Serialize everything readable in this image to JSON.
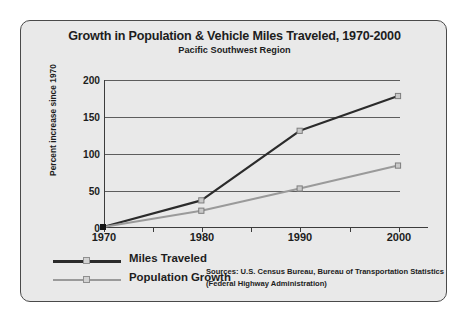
{
  "chart_data": {
    "type": "line",
    "title": "Growth in Population & Vehicle Miles Traveled, 1970-2000",
    "subtitle": "Pacific Southwest Region",
    "xlabel": "",
    "ylabel": "Percent increase since 1970",
    "x": [
      1970,
      1980,
      1990,
      2000
    ],
    "xtick_labels": [
      "1970",
      "1980",
      "1990",
      "2000"
    ],
    "ytick_labels": [
      "0",
      "50",
      "100",
      "150",
      "200"
    ],
    "yticks": [
      0,
      50,
      100,
      150,
      200
    ],
    "ylim": [
      0,
      200
    ],
    "xlim": [
      1970,
      2000
    ],
    "grid": "horizontal",
    "legend_position": "bottom-left",
    "series": [
      {
        "name": "Miles Traveled",
        "color": "#2b2b2b",
        "values": [
          0,
          36,
          130,
          177
        ]
      },
      {
        "name": "Population Growth",
        "color": "#9a9a9a",
        "values": [
          0,
          22,
          52,
          83
        ]
      }
    ],
    "annotations": [
      "Sources: U.S. Census Bureau, Bureau of Transportation Statistics",
      "(Federal Highway Administration)"
    ]
  },
  "figure": {
    "background": "#ffffff",
    "panel_background": "#e9e9e9",
    "border_color": "#4a4a4a",
    "axis_color": "#3c3c3c",
    "gridline_color": "#5d5d5d"
  },
  "sources": {
    "line1": "Sources: U.S. Census Bureau, Bureau of Transportation Statistics",
    "line2": "(Federal Highway Administration)"
  }
}
